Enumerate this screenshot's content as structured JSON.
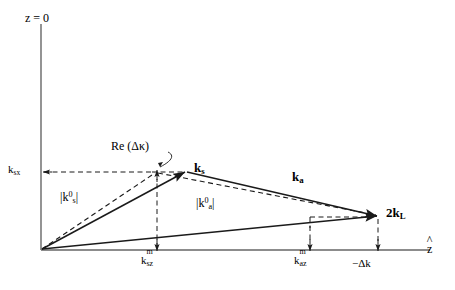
{
  "figure": {
    "type": "vector-diagram",
    "background": "#ffffff",
    "line_color": "#1a1a1a",
    "axis_color": "#555555"
  },
  "axes": {
    "vertical": {
      "label": "z = 0",
      "x": 41,
      "top_y": 24,
      "bottom_y": 250
    },
    "horizontal": {
      "label": "z",
      "label_has_hat": true,
      "y": 250,
      "left_x": 41,
      "right_x": 430
    }
  },
  "points": {
    "origin": {
      "x": 41,
      "y": 250
    },
    "ks_tip": {
      "x": 186,
      "y": 172
    },
    "ks0_tip": {
      "x": 157,
      "y": 172
    },
    "kL_tip": {
      "x": 378,
      "y": 216
    },
    "ksz_axis": {
      "x": 157,
      "y": 250
    },
    "kaz_axis": {
      "x": 310,
      "y": 250
    },
    "dk_axis": {
      "x": 378,
      "y": 250
    }
  },
  "vectors": [
    {
      "name": "k_s",
      "label": "k",
      "sub": "s",
      "style": "solid",
      "from": "origin",
      "to": "ks_tip"
    },
    {
      "name": "k_a",
      "label": "k",
      "sub": "a",
      "style": "solid",
      "from": "ks_tip",
      "to": "kL_tip"
    },
    {
      "name": "2k_L",
      "label": "2k",
      "sub": "L",
      "style": "solid",
      "from": "origin",
      "to": "kL_tip"
    },
    {
      "name": "k_s0",
      "label": "|k",
      "sup": "0",
      "sub": "s",
      "style": "dashed",
      "from": "origin",
      "to": "ks0_tip"
    },
    {
      "name": "k_a0",
      "label": "|k",
      "sup": "0",
      "sub": "a",
      "style": "dashed",
      "from": "ks0_tip",
      "to": "kL_tip"
    }
  ],
  "labels": {
    "z_zero": "z = 0",
    "z_hat": "z",
    "ksx": {
      "base": "k",
      "sub": "sx"
    },
    "ks": {
      "base": "k",
      "sub": "s"
    },
    "ka": {
      "base": "k",
      "sub": "a"
    },
    "kL": {
      "base": "2k",
      "sub": "L"
    },
    "ks0_mag": {
      "open": "|",
      "base": "k",
      "sup": "0",
      "sub": "s",
      "close": "|"
    },
    "ka0_mag": {
      "open": "|",
      "base": "k",
      "sup": "0",
      "sub": "a",
      "close": "|"
    },
    "ksz_m": {
      "base": "k",
      "sup": "m",
      "sub": "sz"
    },
    "kaz_m": {
      "base": "k",
      "sup": "m",
      "sub": "az"
    },
    "delta_k": "−Δk",
    "re_dkappa": "Re (Δκ)"
  }
}
